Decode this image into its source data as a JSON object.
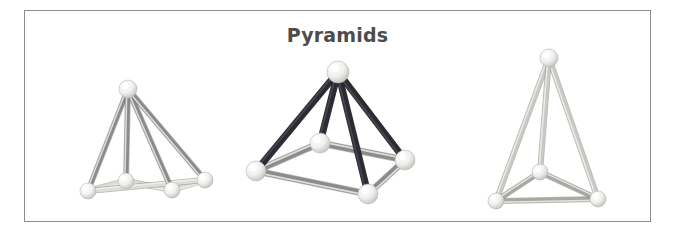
{
  "figure": {
    "title": "Pyramids",
    "title_color": "#4c4c4c",
    "background_color": "#ffffff",
    "border_color": "#8d8d8d",
    "frame": {
      "x": 24,
      "y": 10,
      "width": 627,
      "height": 212
    }
  },
  "palette": {
    "strut_dark": "#2b2b33",
    "strut_medium": "#8b8b8b",
    "strut_medium_dark": "#7c7c7c",
    "strut_light": "#c9c9c4",
    "strut_pale": "#d8d8d2",
    "joint_white": "#efefef",
    "joint_shadow": "#bdbdbd",
    "joint_highlight": "#fbfbfb"
  },
  "models": [
    {
      "name": "square-pyramid-edge-on",
      "label": "Square pyramid, near edge-on view",
      "base_sides": 4,
      "strut_color": "#8b8b8b",
      "base_strut_color": "#dcdcd8",
      "apex": {
        "x": 128,
        "y": 89
      },
      "base_vertices": [
        {
          "x": 88,
          "y": 191
        },
        {
          "x": 126,
          "y": 181
        },
        {
          "x": 172,
          "y": 190
        },
        {
          "x": 205,
          "y": 180
        }
      ],
      "joint_radius": 8
    },
    {
      "name": "square-pyramid-three-quarter",
      "label": "Square pyramid, three-quarter view",
      "base_sides": 4,
      "strut_color": "#2b2b33",
      "base_strut_color": "#8b8b8b",
      "apex": {
        "x": 338,
        "y": 72
      },
      "base_vertices": [
        {
          "x": 256,
          "y": 171
        },
        {
          "x": 368,
          "y": 194
        },
        {
          "x": 405,
          "y": 160
        },
        {
          "x": 320,
          "y": 143
        }
      ],
      "joint_radius": 10
    },
    {
      "name": "triangular-pyramid-tetrahedron",
      "label": "Triangular pyramid (tetrahedron)",
      "base_sides": 3,
      "strut_color": "#c9c9c4",
      "base_strut_color": "#a8a8a2",
      "apex": {
        "x": 549,
        "y": 58
      },
      "base_vertices": [
        {
          "x": 496,
          "y": 201
        },
        {
          "x": 598,
          "y": 199
        },
        {
          "x": 540,
          "y": 172
        }
      ],
      "joint_radius": 8
    }
  ]
}
